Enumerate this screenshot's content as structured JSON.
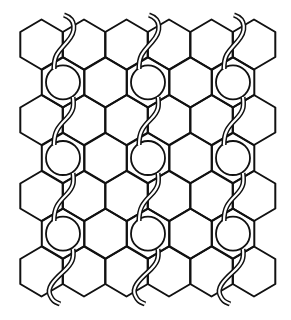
{
  "figure": {
    "title": "",
    "stroke_color": "#111111",
    "background_color": "#ffffff"
  },
  "lattice": {
    "hex_half_width": 21.25,
    "hex_radius": 25,
    "row_centers_y": [
      44.5,
      82.3,
      120,
      158,
      196,
      233.7,
      271.5
    ],
    "odd_row_centers_x": [
      41.5,
      84,
      126.5,
      169,
      211.5,
      254
    ],
    "even_row_centers_x": [
      63,
      105.5,
      148,
      190.5,
      233
    ],
    "rows": 7
  },
  "rings": {
    "radius": 17,
    "columns_x": [
      63,
      148,
      233
    ],
    "rows_y": [
      82.3,
      158,
      233.7
    ]
  },
  "tubes": {
    "columns_x": [
      63,
      148,
      233
    ],
    "count": 3
  }
}
